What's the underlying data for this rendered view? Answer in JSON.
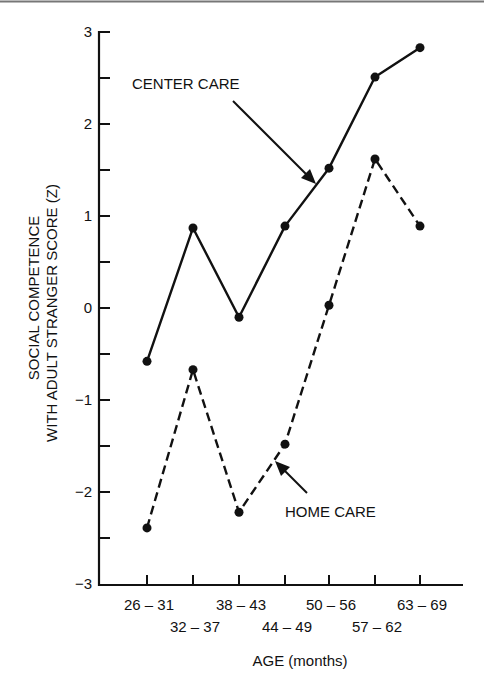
{
  "chart_data": {
    "type": "line",
    "title": "",
    "xlabel": "AGE (months)",
    "ylabel": [
      "SOCIAL COMPETENCE",
      "WITH ADULT STRANGER SCORE (Z)"
    ],
    "categories": [
      "26-31",
      "32-37",
      "38-43",
      "44-49",
      "50-56",
      "57-62",
      "63-69"
    ],
    "category_labels_row1": [
      "26 – 31",
      "38 – 43",
      "50 – 56",
      "63 – 69"
    ],
    "category_labels_row2": [
      "32 – 37",
      "44 – 49",
      "57 – 62"
    ],
    "ylim": [
      -3,
      3
    ],
    "yticks": [
      3,
      2,
      1,
      0,
      -1,
      -2,
      -3
    ],
    "ytick_labels": [
      "3",
      "2",
      "1",
      "0",
      "−1",
      "−2",
      "−3"
    ],
    "minor_yticks": [
      2.5,
      1.5,
      0.5,
      -0.5,
      -1.5,
      -2.5
    ],
    "grid": false,
    "legend": "none (inline annotations with arrows)",
    "series": [
      {
        "name": "CENTER CARE",
        "style": "solid",
        "values": [
          -0.58,
          0.87,
          -0.1,
          0.89,
          1.52,
          2.51,
          2.83
        ]
      },
      {
        "name": "HOME CARE",
        "style": "dashed",
        "values": [
          -2.39,
          -0.67,
          -2.22,
          -1.48,
          0.03,
          1.62,
          0.89
        ]
      }
    ],
    "annotations": [
      {
        "text": "CENTER CARE",
        "points_to": "CENTER CARE line between 44-49 and 50-56"
      },
      {
        "text": "HOME CARE",
        "points_to": "HOME CARE line between 38-43 and 44-49"
      }
    ]
  }
}
